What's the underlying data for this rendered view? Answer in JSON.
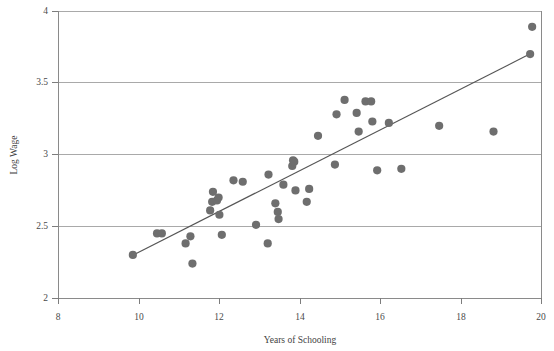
{
  "chart_data": {
    "type": "scatter",
    "title": "",
    "xlabel": "Years of Schooling",
    "ylabel": "Log Wage",
    "xlim": [
      8,
      20
    ],
    "ylim": [
      2,
      4
    ],
    "xticks": [
      8,
      10,
      12,
      14,
      16,
      18,
      20
    ],
    "yticks": [
      2,
      2.5,
      3,
      3.5,
      4
    ],
    "xtick_labels": [
      "8",
      "10",
      "12",
      "14",
      "16",
      "18",
      "20"
    ],
    "ytick_labels": [
      "2",
      "2.5",
      "3",
      "3.5",
      "4"
    ],
    "grid": "horizontal",
    "legend": "none",
    "point_color": "#6e6e6e",
    "line_color": "#555555",
    "series": [
      {
        "name": "observations",
        "type": "scatter",
        "points": [
          [
            9.86,
            2.3
          ],
          [
            10.46,
            2.45
          ],
          [
            10.58,
            2.45
          ],
          [
            11.17,
            2.38
          ],
          [
            11.29,
            2.43
          ],
          [
            11.34,
            2.24
          ],
          [
            11.78,
            2.61
          ],
          [
            11.83,
            2.67
          ],
          [
            11.85,
            2.74
          ],
          [
            11.95,
            2.68
          ],
          [
            11.99,
            2.7
          ],
          [
            12.01,
            2.58
          ],
          [
            12.07,
            2.44
          ],
          [
            12.36,
            2.82
          ],
          [
            12.59,
            2.81
          ],
          [
            12.92,
            2.51
          ],
          [
            13.21,
            2.38
          ],
          [
            13.23,
            2.86
          ],
          [
            13.4,
            2.66
          ],
          [
            13.46,
            2.6
          ],
          [
            13.48,
            2.55
          ],
          [
            13.6,
            2.79
          ],
          [
            13.82,
            2.92
          ],
          [
            13.84,
            2.96
          ],
          [
            13.87,
            2.95
          ],
          [
            13.9,
            2.75
          ],
          [
            14.18,
            2.67
          ],
          [
            14.24,
            2.76
          ],
          [
            14.46,
            3.13
          ],
          [
            14.88,
            2.93
          ],
          [
            14.92,
            3.28
          ],
          [
            15.12,
            3.38
          ],
          [
            15.42,
            3.29
          ],
          [
            15.47,
            3.16
          ],
          [
            15.64,
            3.37
          ],
          [
            15.78,
            3.37
          ],
          [
            15.81,
            3.23
          ],
          [
            15.93,
            2.89
          ],
          [
            16.22,
            3.22
          ],
          [
            16.53,
            2.9
          ],
          [
            17.47,
            3.2
          ],
          [
            18.82,
            3.16
          ],
          [
            19.73,
            3.7
          ],
          [
            19.78,
            3.89
          ]
        ]
      },
      {
        "name": "fitted-regression-line",
        "type": "line",
        "endpoints": [
          [
            9.87,
            2.3
          ],
          [
            19.72,
            3.7
          ]
        ]
      }
    ]
  },
  "figure": {
    "top_clipped_title": "",
    "y_axis_title": "Log Wage",
    "x_axis_title": "Years of Schooling"
  }
}
